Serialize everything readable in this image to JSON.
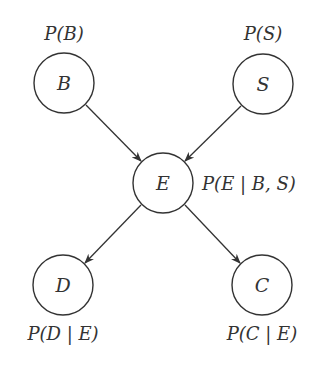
{
  "diagram": {
    "type": "bayesian-network",
    "nodes": [
      {
        "id": "B",
        "label": "B",
        "prob": "P(B)",
        "cx": 64,
        "cy": 83
      },
      {
        "id": "S",
        "label": "S",
        "prob": "P(S)",
        "cx": 263,
        "cy": 84
      },
      {
        "id": "E",
        "label": "E",
        "prob": "P(E | B, S)",
        "cx": 163,
        "cy": 183
      },
      {
        "id": "D",
        "label": "D",
        "prob": "P(D | E)",
        "cx": 63,
        "cy": 285
      },
      {
        "id": "C",
        "label": "C",
        "prob": "P(C | E)",
        "cx": 262,
        "cy": 285
      }
    ],
    "edges": [
      {
        "from": "B",
        "to": "E"
      },
      {
        "from": "S",
        "to": "E"
      },
      {
        "from": "E",
        "to": "D"
      },
      {
        "from": "E",
        "to": "C"
      }
    ],
    "colors": {
      "stroke": "#333333",
      "text": "#333333",
      "background": "#ffffff"
    }
  }
}
